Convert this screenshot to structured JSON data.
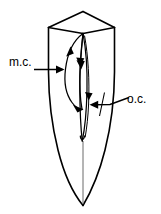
{
  "figure": {
    "kind": "anatomical-line-drawing",
    "background_color": "#ffffff",
    "line_color": "#000000"
  },
  "labels": {
    "mesial_canal": {
      "text": "m.c.",
      "meaning": "mesial canal",
      "position": "left",
      "arrow_direction": "right"
    },
    "other_canal": {
      "text": "o.c.",
      "meaning": "other canal",
      "position": "right",
      "arrow_direction": "left"
    }
  },
  "structures": {
    "crown": "pointed incisal ridge with faceted mesial and distal slopes",
    "root": "long tapering root ending in a sharp apex",
    "canal_mesial": "broad elongated oval canal with downward flow arrows",
    "canal_other": "narrow elongated canal running beside the mesial canal",
    "apical_line": "fine line continuing from canal to root apex"
  },
  "arrows": {
    "flow_arrow_count": 5,
    "pointer_arrow_count": 2
  }
}
